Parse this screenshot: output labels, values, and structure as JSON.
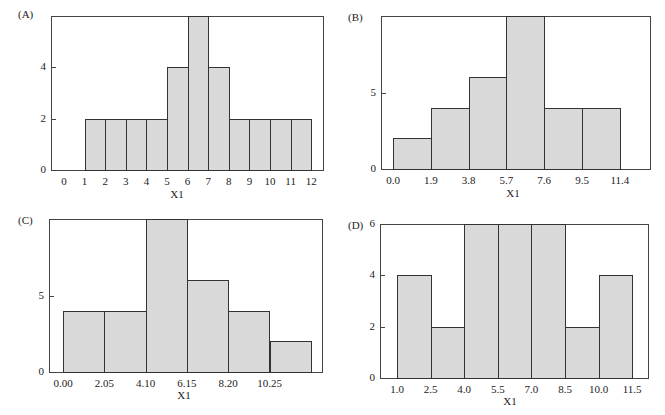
{
  "chart_data": [
    {
      "panel": "(A)",
      "type": "bar",
      "title": "",
      "xlabel": "X1",
      "ylabel": "",
      "bin_edges": [
        1,
        2,
        3,
        4,
        5,
        6,
        7,
        8,
        9,
        10,
        11,
        12
      ],
      "values": [
        2,
        2,
        2,
        2,
        4,
        6,
        4,
        2,
        2,
        2,
        2
      ],
      "xticks": [
        "0",
        "1",
        "2",
        "3",
        "4",
        "5",
        "6",
        "7",
        "8",
        "9",
        "10",
        "11",
        "12"
      ],
      "xlim": [
        -0.5,
        12.7
      ],
      "yticks": [
        "0",
        "2",
        "4"
      ],
      "ylim": [
        0,
        6
      ],
      "grid": false
    },
    {
      "panel": "(B)",
      "type": "bar",
      "title": "",
      "xlabel": "X1",
      "ylabel": "",
      "bin_edges": [
        0.0,
        1.9,
        3.8,
        5.7,
        7.6,
        9.5,
        11.4
      ],
      "values": [
        2,
        4,
        6,
        10,
        4,
        4
      ],
      "xticks": [
        "0.0",
        "1.9",
        "3.8",
        "5.7",
        "7.6",
        "9.5",
        "11.4"
      ],
      "xlim": [
        -0.6,
        13.3
      ],
      "yticks": [
        "0",
        "5"
      ],
      "ylim": [
        0,
        10
      ],
      "grid": false
    },
    {
      "panel": "(C)",
      "type": "bar",
      "title": "",
      "xlabel": "X1",
      "ylabel": "",
      "bin_edges": [
        0.0,
        2.05,
        4.1,
        6.15,
        8.2,
        10.25,
        12.3
      ],
      "values": [
        4,
        4,
        10,
        6,
        4,
        2
      ],
      "xticks": [
        "0.00",
        "2.05",
        "4.10",
        "6.15",
        "8.20",
        "10.25"
      ],
      "xlim": [
        -0.65,
        12.8
      ],
      "yticks": [
        "0",
        "5"
      ],
      "ylim": [
        0,
        10
      ],
      "grid": false
    },
    {
      "panel": "(D)",
      "type": "bar",
      "title": "",
      "xlabel": "X1",
      "ylabel": "",
      "bin_edges": [
        1.0,
        2.5,
        4.0,
        5.5,
        7.0,
        8.5,
        10.0,
        11.5
      ],
      "values": [
        4,
        2,
        6,
        6,
        6,
        2,
        4
      ],
      "xticks": [
        "1.0",
        "2.5",
        "4.0",
        "5.5",
        "7.0",
        "8.5",
        "10.0",
        "11.5"
      ],
      "xlim": [
        -0.8,
        13.0
      ],
      "yticks": [
        "0",
        "2",
        "4",
        "6"
      ],
      "ylim": [
        0,
        6
      ],
      "grid": false
    }
  ],
  "panels": {
    "a": {
      "label": "(A)",
      "xlabel": "X1"
    },
    "b": {
      "label": "(B)",
      "xlabel": "X1"
    },
    "c": {
      "label": "(C)",
      "xlabel": "X1"
    },
    "d": {
      "label": "(D)",
      "xlabel": "X1"
    }
  },
  "colors": {
    "bar_fill": "#d9d9d9",
    "bar_edge": "#333333",
    "frame": "#444444"
  }
}
